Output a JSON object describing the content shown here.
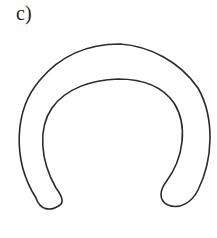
{
  "figure": {
    "label": "c)",
    "shape": "horseshoe-arc-outline",
    "stroke_color": "#2a2a2a",
    "background": "#ffffff"
  }
}
